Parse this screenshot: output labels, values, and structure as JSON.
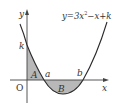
{
  "diagram": {
    "type": "function-graph",
    "equation": {
      "prefix": "y=3x",
      "exponent": "2",
      "suffix": "−x+k"
    },
    "axes": {
      "x_label": "x",
      "y_label": "y",
      "origin_label": "O"
    },
    "points": {
      "y_intercept": "k",
      "root_left": "a",
      "root_right": "b"
    },
    "regions": {
      "region_A": "A",
      "region_B": "B"
    },
    "colors": {
      "curve": "#2a2a2a",
      "axis": "#444444",
      "shade": "#b8b8b8",
      "text": "#333333"
    }
  }
}
